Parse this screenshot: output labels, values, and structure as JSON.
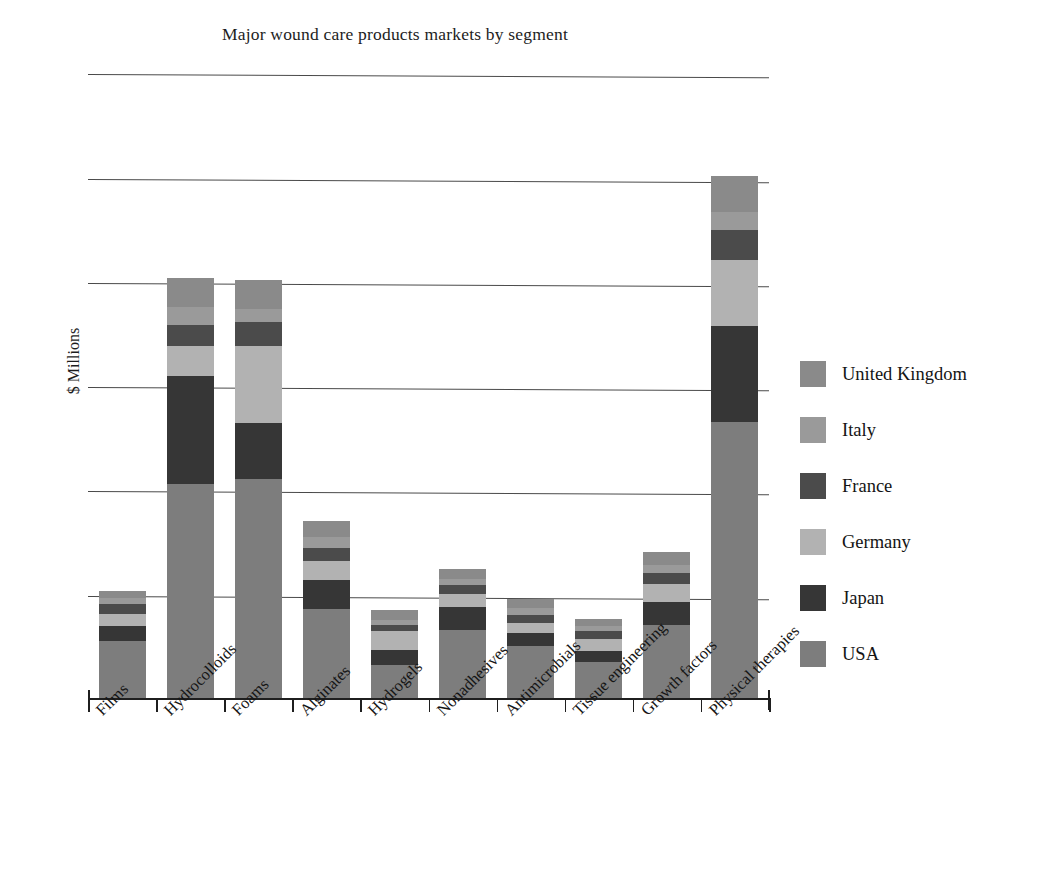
{
  "chart_data": {
    "type": "bar",
    "stacked": true,
    "title": "Major wound care products markets by segment",
    "xlabel": "",
    "ylabel": "$ Millions",
    "categories": [
      "Films",
      "Hydrocolloids",
      "Foams",
      "Alginates",
      "Hydrogels",
      "Nonadhesives",
      "Antimicrobials",
      "Tissue engineering",
      "Growth factors",
      "Physical therapies"
    ],
    "series": [
      {
        "name": "USA",
        "color": "#7d7d7d",
        "values": [
          55,
          205,
          210,
          85,
          32,
          65,
          50,
          35,
          70,
          265
        ]
      },
      {
        "name": "Japan",
        "color": "#363636",
        "values": [
          14,
          104,
          54,
          28,
          14,
          22,
          12,
          10,
          22,
          92
        ]
      },
      {
        "name": "Germany",
        "color": "#b2b2b2",
        "values": [
          12,
          29,
          74,
          18,
          18,
          13,
          10,
          12,
          17,
          63
        ]
      },
      {
        "name": "France",
        "color": "#4b4b4b",
        "values": [
          9,
          20,
          23,
          13,
          6,
          8,
          8,
          7,
          11,
          29
        ]
      },
      {
        "name": "Italy",
        "color": "#9a9a9a",
        "values": [
          6,
          17,
          12,
          10,
          5,
          6,
          6,
          5,
          8,
          17
        ]
      },
      {
        "name": "United Kingdom",
        "color": "#8a8a8a",
        "values": [
          7,
          28,
          28,
          16,
          9,
          10,
          9,
          7,
          12,
          35
        ]
      }
    ],
    "ylim": [
      0,
      610
    ],
    "gridlines": [
      100,
      200,
      300,
      400,
      500,
      600
    ],
    "grid": true,
    "legend_position": "right",
    "units": "$ Millions"
  },
  "legend": {
    "entries": [
      {
        "label": "United Kingdom",
        "color": "#8a8a8a"
      },
      {
        "label": "Italy",
        "color": "#9a9a9a"
      },
      {
        "label": "France",
        "color": "#4b4b4b"
      },
      {
        "label": "Germany",
        "color": "#b2b2b2"
      },
      {
        "label": "Japan",
        "color": "#363636"
      },
      {
        "label": "USA",
        "color": "#7d7d7d"
      }
    ]
  }
}
